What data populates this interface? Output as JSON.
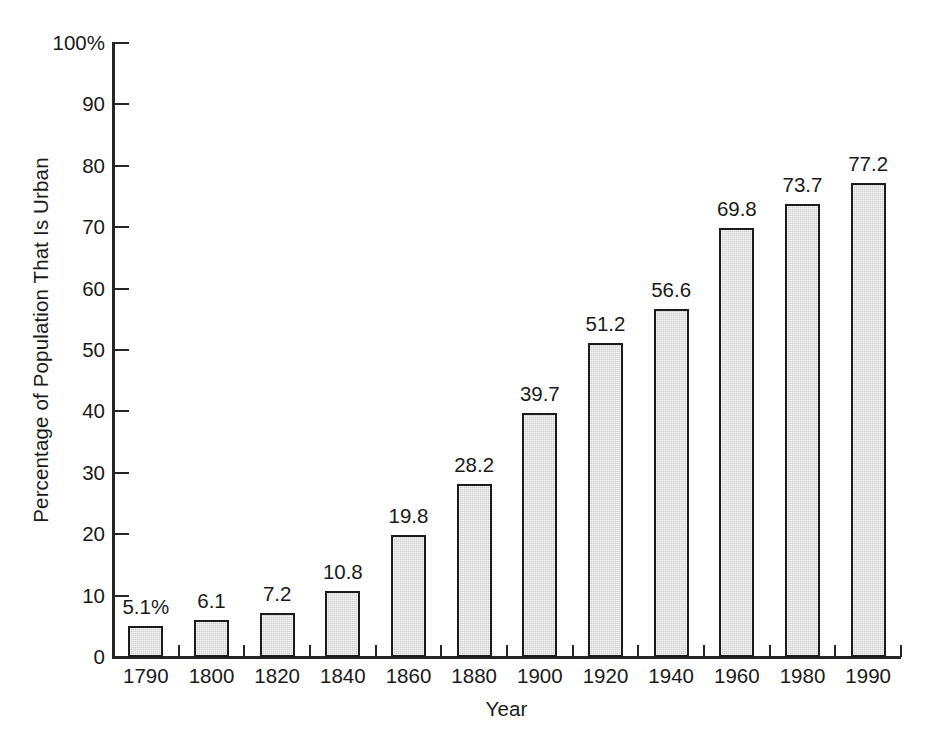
{
  "chart_data": {
    "type": "bar",
    "title": "",
    "xlabel": "Year",
    "ylabel": "Percentage of Population That Is Urban",
    "categories": [
      "1790",
      "1800",
      "1820",
      "1840",
      "1860",
      "1880",
      "1900",
      "1920",
      "1940",
      "1960",
      "1980",
      "1990"
    ],
    "values": [
      5.1,
      6.1,
      7.2,
      10.8,
      19.8,
      28.2,
      39.7,
      51.2,
      56.6,
      69.8,
      73.7,
      77.2
    ],
    "point_labels": [
      "5.1%",
      "6.1",
      "7.2",
      "10.8",
      "19.8",
      "28.2",
      "39.7",
      "51.2",
      "56.6",
      "69.8",
      "73.7",
      "77.2"
    ],
    "ylim": [
      0,
      100
    ],
    "ytick_values": [
      0,
      10,
      20,
      30,
      40,
      50,
      60,
      70,
      80,
      90,
      100
    ],
    "ytick_labels": [
      "0",
      "10",
      "20",
      "30",
      "40",
      "50",
      "60",
      "70",
      "80",
      "90",
      "100%"
    ],
    "grid": false,
    "legend": null,
    "bar_fill_color": "#cfcfcf",
    "bar_border_color": "#1c1c1c",
    "axis_color": "#262626",
    "text_color": "#1a1a1a",
    "background_color": "#ffffff"
  }
}
